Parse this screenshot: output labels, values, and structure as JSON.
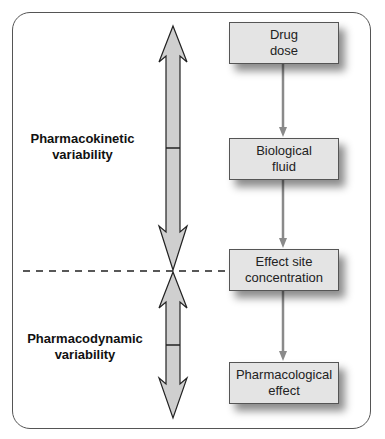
{
  "diagram": {
    "type": "flowchart",
    "left_labels": {
      "pharmacokinetic": "Pharmacokinetic\nvariability",
      "pharmacodynamic": "Pharmacodynamic\nvariability"
    },
    "boxes": [
      {
        "id": "drug-dose",
        "label": "Drug\ndose"
      },
      {
        "id": "biological-fluid",
        "label": "Biological\nfluid"
      },
      {
        "id": "effect-site-concentration",
        "label": "Effect site\nconcentration"
      },
      {
        "id": "pharmacological-effect",
        "label": "Pharmacological\neffect"
      }
    ],
    "edges": [
      {
        "from": "drug-dose",
        "to": "biological-fluid"
      },
      {
        "from": "biological-fluid",
        "to": "effect-site-concentration"
      },
      {
        "from": "effect-site-concentration",
        "to": "pharmacological-effect"
      }
    ],
    "colors": {
      "box_fill": "#e4e4e4",
      "arrow_fill": "#cfcfcf",
      "connector": "#8a8a8a",
      "frame": "#555555"
    }
  }
}
